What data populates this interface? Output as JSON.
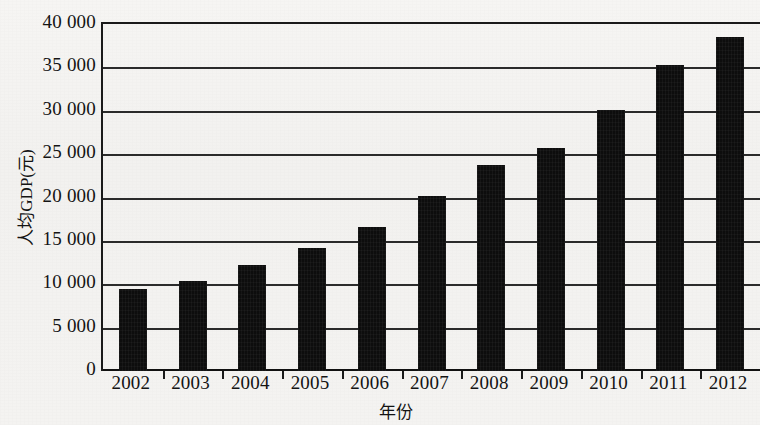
{
  "chart_data": {
    "type": "bar",
    "title": "",
    "xlabel": "年份",
    "ylabel": "人均GDP(元)",
    "categories": [
      "2002",
      "2003",
      "2004",
      "2005",
      "2006",
      "2007",
      "2008",
      "2009",
      "2010",
      "2011",
      "2012"
    ],
    "values": [
      9400,
      10400,
      12200,
      14200,
      16600,
      20200,
      23800,
      25700,
      30100,
      35300,
      38500
    ],
    "ylim": [
      0,
      40000
    ],
    "ytick_values": [
      0,
      5000,
      10000,
      15000,
      20000,
      25000,
      30000,
      35000,
      40000
    ],
    "ytick_labels": [
      "0",
      "5 000",
      "10 000",
      "15 000",
      "20 000",
      "25 000",
      "30 000",
      "35 000",
      "40 000"
    ],
    "grid": "horizontal",
    "legend": "none",
    "bar_color": "#0d0d0d",
    "axis_color": "#1a1a1a",
    "background_color": "#f4f3f1"
  }
}
